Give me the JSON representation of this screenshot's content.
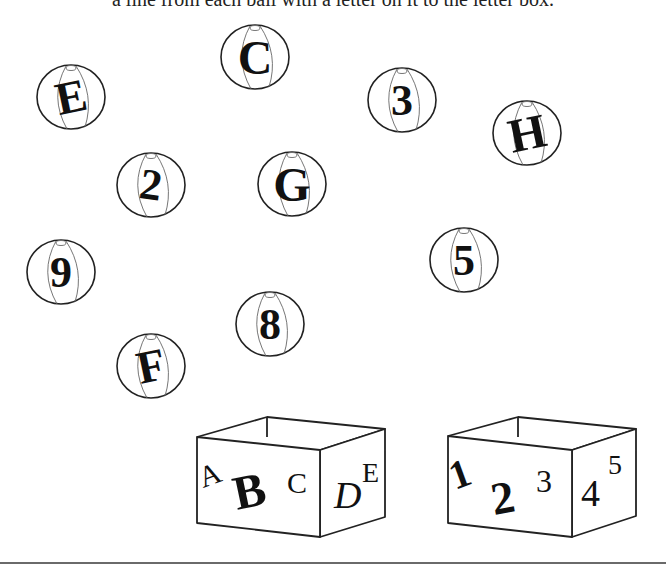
{
  "instruction": "a line from each ball with a letter on it to the letter box.",
  "colors": {
    "ink": "#111111",
    "stripe": "#666666",
    "rule": "#6a6a6a",
    "background": "#ffffff"
  },
  "balls": [
    {
      "label": "E",
      "cx": 71,
      "cy": 97,
      "tilt": -12,
      "size": 46
    },
    {
      "label": "C",
      "cx": 255,
      "cy": 57,
      "tilt": 0,
      "size": 48
    },
    {
      "label": "3",
      "cx": 402,
      "cy": 100,
      "tilt": 0,
      "size": 44
    },
    {
      "label": "H",
      "cx": 527,
      "cy": 133,
      "tilt": -12,
      "size": 48
    },
    {
      "label": "2",
      "cx": 151,
      "cy": 185,
      "tilt": 8,
      "size": 44
    },
    {
      "label": "G",
      "cx": 292,
      "cy": 184,
      "tilt": 0,
      "size": 48
    },
    {
      "label": "9",
      "cx": 61,
      "cy": 272,
      "tilt": 0,
      "size": 44
    },
    {
      "label": "5",
      "cx": 464,
      "cy": 260,
      "tilt": 0,
      "size": 44
    },
    {
      "label": "8",
      "cx": 270,
      "cy": 324,
      "tilt": 0,
      "size": 44
    },
    {
      "label": "F",
      "cx": 151,
      "cy": 366,
      "tilt": -12,
      "size": 46
    }
  ],
  "boxes": [
    {
      "name": "letter-box",
      "front_glyphs": [
        {
          "text": "A",
          "x": 203,
          "y": 488,
          "size": 30,
          "rotate": -20,
          "weight": "normal"
        },
        {
          "text": "B",
          "x": 237,
          "y": 510,
          "size": 48,
          "rotate": -12,
          "weight": "bold"
        },
        {
          "text": "C",
          "x": 287,
          "y": 493,
          "size": 30,
          "rotate": 0,
          "weight": "normal"
        }
      ],
      "side_glyphs": [
        {
          "text": "D",
          "x": 334,
          "y": 508,
          "size": 38,
          "rotate": 0,
          "weight": "normal",
          "italic": true
        },
        {
          "text": "E",
          "x": 362,
          "y": 482,
          "size": 28,
          "rotate": 0,
          "weight": "normal",
          "italic": false
        }
      ],
      "geometry": {
        "ftl": [
          197,
          437
        ],
        "ftr": [
          320,
          450
        ],
        "fbr": [
          320,
          537
        ],
        "fbl": [
          197,
          523
        ],
        "btl": [
          267,
          417
        ],
        "btr": [
          385,
          429
        ],
        "sbr": [
          385,
          517
        ]
      }
    },
    {
      "name": "number-box",
      "front_glyphs": [
        {
          "text": "1",
          "x": 455,
          "y": 490,
          "size": 40,
          "rotate": -20,
          "weight": "bold"
        },
        {
          "text": "2",
          "x": 494,
          "y": 515,
          "size": 46,
          "rotate": -10,
          "weight": "bold"
        },
        {
          "text": "3",
          "x": 536,
          "y": 492,
          "size": 32,
          "rotate": 0,
          "weight": "normal"
        }
      ],
      "side_glyphs": [
        {
          "text": "4",
          "x": 581,
          "y": 506,
          "size": 38,
          "rotate": 0,
          "weight": "normal",
          "italic": false
        },
        {
          "text": "5",
          "x": 608,
          "y": 474,
          "size": 28,
          "rotate": 0,
          "weight": "normal",
          "italic": false
        }
      ],
      "geometry": {
        "ftl": [
          448,
          436
        ],
        "ftr": [
          572,
          450
        ],
        "fbr": [
          572,
          537
        ],
        "fbl": [
          448,
          523
        ],
        "btl": [
          518,
          417
        ],
        "btr": [
          636,
          429
        ],
        "sbr": [
          636,
          516
        ]
      }
    }
  ]
}
